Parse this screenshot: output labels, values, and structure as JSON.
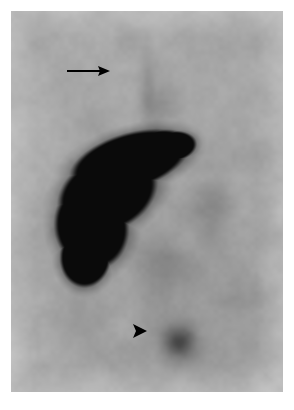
{
  "figure": {
    "modality_appearance": "grayscale planar nuclear-medicine scintigram",
    "plate": {
      "x": 11,
      "y": 11,
      "width": 272,
      "height": 381,
      "background_gray": "#a9a9a9",
      "border_color": "#ffffff"
    },
    "background_colors": {
      "page": "#ffffff",
      "soft_tissue_light": "#b6b6b6",
      "soft_tissue_mid": "#a2a2a2",
      "soft_tissue_dark": "#8e8e8e",
      "lesion_black": "#0b0b0b",
      "annotation_black": "#000000"
    }
  },
  "image_content": {
    "main_mass": {
      "name": "large-intense-uptake-mass",
      "description": "large black region of intense tracer uptake, upper-left to mid-left of field",
      "center_x": 110,
      "center_y": 195,
      "bounds": {
        "left": 38,
        "top": 110,
        "right": 192,
        "bottom": 272
      }
    },
    "focal_spot": {
      "name": "small-focal-uptake",
      "description": "small rounded focus of mildly increased uptake, lower mid-field",
      "center_x": 168,
      "center_y": 330,
      "radius": 16
    },
    "faint_foci": [
      {
        "center_x": 200,
        "center_y": 195,
        "radius": 22,
        "intensity": "faint"
      },
      {
        "center_x": 146,
        "center_y": 90,
        "radius": 16,
        "intensity": "faint"
      },
      {
        "center_x": 150,
        "center_y": 250,
        "radius": 26,
        "intensity": "faint"
      },
      {
        "center_x": 72,
        "center_y": 300,
        "radius": 30,
        "intensity": "very-faint"
      },
      {
        "center_x": 225,
        "center_y": 300,
        "radius": 30,
        "intensity": "very-faint"
      }
    ]
  },
  "annotations": {
    "arrow": {
      "name": "arrow-annotation",
      "label": "arrow",
      "direction": "right",
      "tail_x": 56,
      "tail_y": 60,
      "tip_x": 99,
      "tip_y": 60,
      "shaft_thickness": 2,
      "head_length": 12,
      "head_halfwidth": 5,
      "color": "#000000"
    },
    "arrowhead": {
      "name": "arrowhead-annotation",
      "label": "arrowhead",
      "direction": "right",
      "tip_x": 136,
      "tip_y": 320,
      "base_x": 122,
      "half_height": 7,
      "color": "#000000"
    }
  }
}
